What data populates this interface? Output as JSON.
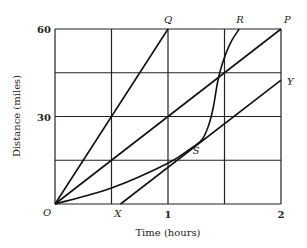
{
  "chart_data": {
    "type": "line",
    "title": "",
    "xlabel": "Time (hours)",
    "ylabel": "Distance (miles)",
    "xlim": [
      0,
      2
    ],
    "ylim": [
      0,
      60
    ],
    "grid": true,
    "x_gridlines": [
      0,
      0.5,
      1,
      1.5,
      2
    ],
    "y_gridlines": [
      0,
      15,
      30,
      45,
      60
    ],
    "x_tick_labels": [
      {
        "value": 1,
        "label": "1"
      },
      {
        "value": 2,
        "label": "2"
      }
    ],
    "y_tick_labels": [
      {
        "value": 30,
        "label": "30"
      },
      {
        "value": 60,
        "label": "60"
      }
    ],
    "series": [
      {
        "name": "OQ",
        "kind": "line",
        "points": [
          [
            0,
            0
          ],
          [
            1,
            60
          ]
        ]
      },
      {
        "name": "OP",
        "kind": "line",
        "points": [
          [
            0,
            0
          ],
          [
            2,
            60
          ]
        ]
      },
      {
        "name": "XY",
        "kind": "line",
        "points": [
          [
            0.58,
            0
          ],
          [
            2,
            42.5
          ]
        ]
      },
      {
        "name": "OSR",
        "kind": "curve",
        "points": [
          [
            0,
            0
          ],
          [
            0.5,
            5.5
          ],
          [
            1.0,
            14
          ],
          [
            1.2,
            19
          ],
          [
            1.3,
            22
          ],
          [
            1.36,
            27
          ],
          [
            1.4,
            33
          ],
          [
            1.44,
            42
          ],
          [
            1.48,
            48
          ],
          [
            1.55,
            55
          ],
          [
            1.63,
            60
          ]
        ]
      }
    ],
    "annotations": [
      {
        "text": "O",
        "x": 0,
        "y": 0,
        "dx": -12,
        "dy": 12
      },
      {
        "text": "X",
        "x": 0.55,
        "y": 0,
        "dx": -3,
        "dy": 13
      },
      {
        "text": "Q",
        "x": 1,
        "y": 60,
        "dx": -4,
        "dy": -6
      },
      {
        "text": "R",
        "x": 1.63,
        "y": 60,
        "dx": -3,
        "dy": -6
      },
      {
        "text": "P",
        "x": 2,
        "y": 60,
        "dx": 3,
        "dy": -6
      },
      {
        "text": "Y",
        "x": 2,
        "y": 42.5,
        "dx": 6,
        "dy": 5
      },
      {
        "text": "S",
        "x": 1.22,
        "y": 17,
        "dx": 0,
        "dy": 0
      }
    ]
  }
}
